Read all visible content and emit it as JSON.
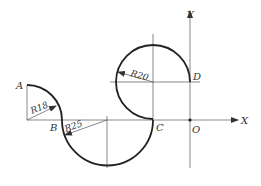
{
  "diagram": {
    "type": "geometric construction",
    "axes": {
      "x_label": "X",
      "y_label": "Y"
    },
    "points": {
      "A": "A",
      "B": "B",
      "C": "C",
      "D": "D",
      "O": "O"
    },
    "dimensions": {
      "r18": "R18",
      "r25": "R25",
      "r20": "R20"
    },
    "colors": {
      "stroke": "#222222",
      "thin": "#555555",
      "background": "#ffffff"
    }
  }
}
